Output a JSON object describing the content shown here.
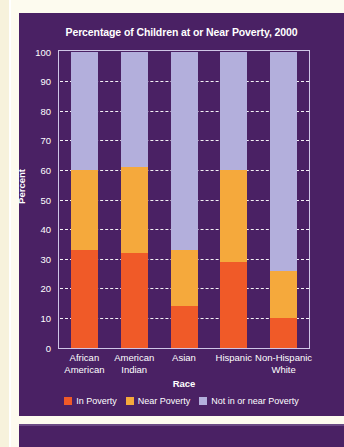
{
  "chart_data": {
    "type": "bar",
    "subtype": "stacked-100",
    "title": "Percentage of Children at or Near Poverty, 2000",
    "xlabel": "Race",
    "ylabel": "Percent",
    "ylim": [
      0,
      100
    ],
    "ytick_step": 10,
    "yticks": [
      100,
      90,
      80,
      70,
      60,
      50,
      40,
      30,
      20,
      10,
      0
    ],
    "grid": true,
    "grid_style": "dashed-white-horizontal",
    "legend_position": "bottom-center",
    "categories": [
      "African American",
      "American Indian",
      "Asian",
      "Hispanic",
      "Non-Hispanic White"
    ],
    "category_lines": [
      [
        "African",
        "American"
      ],
      [
        "American",
        "Indian"
      ],
      [
        "Asian",
        ""
      ],
      [
        "Hispanic",
        ""
      ],
      [
        "Non-Hispanic",
        "White"
      ]
    ],
    "series": [
      {
        "name": "In Poverty",
        "color": "#f05a28",
        "values": [
          33,
          32,
          14,
          29,
          10
        ]
      },
      {
        "name": "Near Poverty",
        "color": "#f5a93c",
        "values": [
          27,
          29,
          19,
          31,
          16
        ]
      },
      {
        "name": "Not in or near Poverty",
        "color": "#b3afdc",
        "values": [
          40,
          39,
          67,
          40,
          74
        ]
      }
    ],
    "cumulative_tops": [
      [
        33,
        60,
        100
      ],
      [
        32,
        61,
        100
      ],
      [
        14,
        33,
        100
      ],
      [
        29,
        60,
        100
      ],
      [
        10,
        26,
        100
      ]
    ]
  },
  "colors": {
    "panel_background": "#4a2164",
    "page_background": "#fdfbef",
    "in_poverty": "#f05a28",
    "near_poverty": "#f5a93c",
    "not_in_or_near_poverty": "#b3afdc",
    "axis_line": "#cfc6e6",
    "text": "#ffffff"
  }
}
